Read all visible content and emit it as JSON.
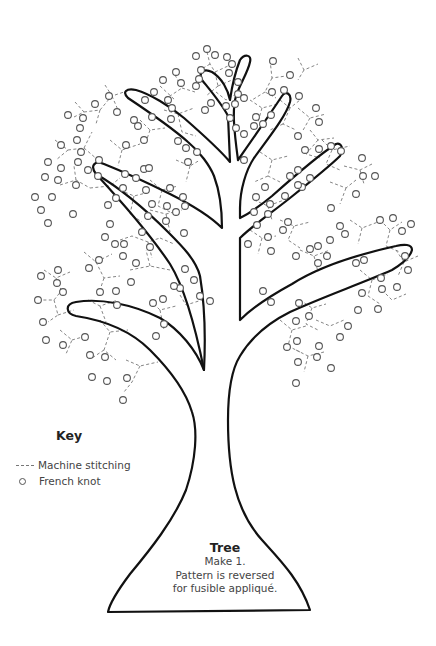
{
  "figure": {
    "outline_color": "#111111",
    "stitch_color": "#777777",
    "knot_color": "#555555"
  },
  "key": {
    "title": "Key",
    "items": [
      {
        "symbol": "dashed-line",
        "label": "Machine stitching"
      },
      {
        "symbol": "circle",
        "label": "French knot"
      }
    ]
  },
  "caption": {
    "title": "Tree",
    "lines": [
      "Make 1.",
      "Pattern is reversed",
      "for fusible appliqué."
    ]
  }
}
